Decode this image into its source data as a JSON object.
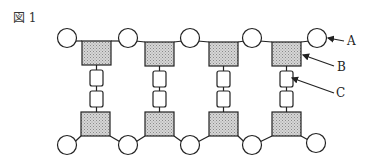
{
  "figure": {
    "title": "図 1",
    "labels": [
      {
        "id": "A",
        "text": "A",
        "x": 347,
        "y": 34
      },
      {
        "id": "B",
        "text": "B",
        "x": 337,
        "y": 60
      },
      {
        "id": "C",
        "text": "C",
        "x": 336,
        "y": 86
      }
    ],
    "colors": {
      "stroke": "#222222",
      "fill_square": "#c8c8c8",
      "fill_circle": "#ffffff",
      "fill_small": "#ffffff"
    },
    "top_row": {
      "circles": [
        {
          "cx": 67,
          "cy": 38
        },
        {
          "cx": 128,
          "cy": 38
        },
        {
          "cx": 190,
          "cy": 38
        },
        {
          "cx": 252,
          "cy": 38
        },
        {
          "cx": 317,
          "cy": 38
        }
      ],
      "squares": [
        {
          "x": 82,
          "y": 41
        },
        {
          "x": 145,
          "y": 42
        },
        {
          "x": 209,
          "y": 42
        },
        {
          "x": 272,
          "y": 42
        }
      ]
    },
    "bottom_row": {
      "circles": [
        {
          "cx": 67,
          "cy": 145
        },
        {
          "cx": 128,
          "cy": 145
        },
        {
          "cx": 190,
          "cy": 145
        },
        {
          "cx": 252,
          "cy": 145
        },
        {
          "cx": 316,
          "cy": 143
        }
      ],
      "squares": [
        {
          "x": 81,
          "y": 112
        },
        {
          "x": 145,
          "y": 112
        },
        {
          "x": 209,
          "y": 112
        },
        {
          "x": 272,
          "y": 112
        }
      ]
    }
  }
}
